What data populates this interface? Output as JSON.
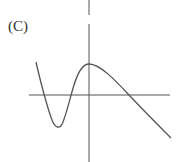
{
  "label": "(C)",
  "graph": {
    "description": "Graph of a function with a local minimum left of the y-axis, a local maximum on the y-axis above the x-axis, and decreasing thereafter",
    "stroke_color": "#555555"
  }
}
